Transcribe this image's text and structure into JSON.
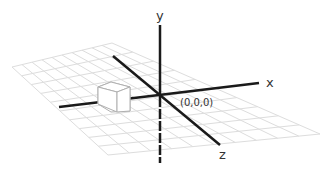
{
  "diagram": {
    "axes": {
      "x_label": "x",
      "y_label": "y",
      "z_label": "z"
    },
    "origin_label": "(0,0,0)",
    "grid": {
      "divisions": 10,
      "color": "#dddddd"
    },
    "axis_color": "#1a1a1a",
    "cube_color": "#b0b0b0",
    "objects": [
      {
        "type": "cube",
        "position": "on negative x-axis"
      }
    ]
  }
}
